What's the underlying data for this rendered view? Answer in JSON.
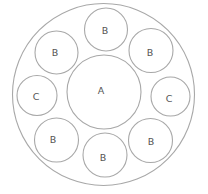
{
  "diagram": {
    "outer": {
      "label": ""
    },
    "center": {
      "label": "A"
    },
    "satellites": [
      {
        "position": "top",
        "label": "B"
      },
      {
        "position": "upper-right",
        "label": "B"
      },
      {
        "position": "right",
        "label": "C"
      },
      {
        "position": "lower-right",
        "label": "B"
      },
      {
        "position": "bottom",
        "label": "B"
      },
      {
        "position": "lower-left",
        "label": "B"
      },
      {
        "position": "left",
        "label": "C"
      },
      {
        "position": "upper-left",
        "label": "B"
      }
    ],
    "colors": {
      "stroke": "#a8a8a8",
      "text": "#555555"
    }
  }
}
